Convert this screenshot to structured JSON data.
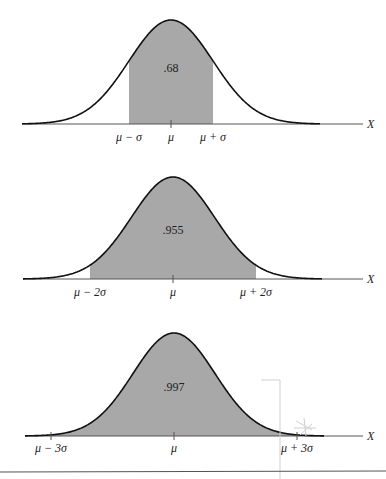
{
  "chart_data": [
    {
      "type": "area",
      "title": "",
      "xlabel": "X",
      "ylabel": "",
      "distribution": "normal",
      "shaded_interval_sigma": [
        -1,
        1
      ],
      "shaded_probability": ".68",
      "tick_labels": [
        "μ − σ",
        "μ",
        "μ + σ"
      ],
      "grid": false,
      "layout": {
        "baseline_y": 124,
        "peak_y": 20,
        "mu_x": 171,
        "sigma_px": 42,
        "axis_x0": 22,
        "axis_x1": 363,
        "curve_x0": 22,
        "curve_x1": 320,
        "label_y": 141,
        "value_y": 72
      }
    },
    {
      "type": "area",
      "title": "",
      "xlabel": "X",
      "ylabel": "",
      "distribution": "normal",
      "shaded_interval_sigma": [
        -2,
        2
      ],
      "shaded_probability": ".955",
      "tick_labels": [
        "μ − 2σ",
        "μ",
        "μ + 2σ"
      ],
      "grid": false,
      "layout": {
        "baseline_y": 279,
        "peak_y": 177,
        "mu_x": 173,
        "sigma_px": 41.5,
        "axis_x0": 23,
        "axis_x1": 363,
        "curve_x0": 23,
        "curve_x1": 322,
        "label_y": 296,
        "value_y": 234
      }
    },
    {
      "type": "area",
      "title": "",
      "xlabel": "X",
      "ylabel": "",
      "distribution": "normal",
      "shaded_interval_sigma": [
        -3,
        3
      ],
      "shaded_probability": ".997",
      "tick_labels": [
        "μ − 3σ",
        "μ",
        "μ + 3σ"
      ],
      "grid": false,
      "layout": {
        "baseline_y": 436,
        "peak_y": 333,
        "mu_x": 174,
        "sigma_px": 41,
        "axis_x0": 25,
        "axis_x1": 363,
        "curve_x0": 25,
        "curve_x1": 324,
        "label_y": 452,
        "value_y": 391
      }
    }
  ],
  "colors": {
    "fill": "#a8a8a8",
    "curve": "#111111",
    "axis": "#555555",
    "text": "#222222",
    "rule": "#555555"
  },
  "axis_label": "X"
}
